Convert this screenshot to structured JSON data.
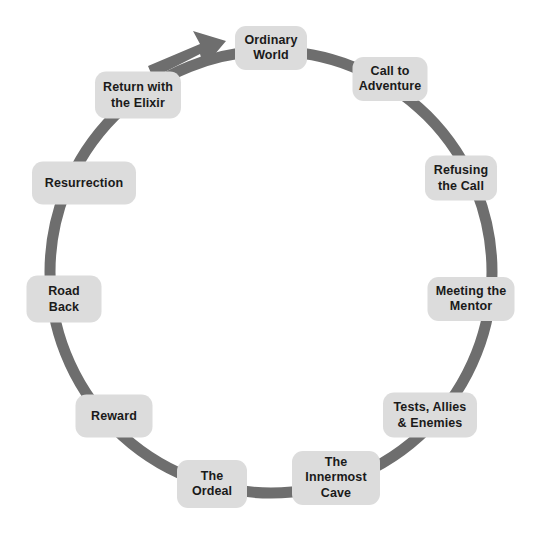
{
  "diagram": {
    "type": "circular-cycle",
    "background_color": "#ffffff",
    "ring": {
      "color": "#6e6e6e",
      "stroke_width": 11,
      "center_x": 271,
      "center_y": 272,
      "radius": 221,
      "direction": "clockwise",
      "arrowhead": {
        "name": "cycle-arrowhead",
        "position_x": 196,
        "position_y": 52,
        "points_toward": "Ordinary World"
      }
    },
    "node_style": {
      "fill": "#dcdcdc",
      "text_color": "#1a1a1a",
      "corner_radius": 11
    },
    "stages": [
      {
        "label": "Ordinary\nWorld",
        "plain": "Ordinary World",
        "order": 1,
        "x": 271,
        "y": 48,
        "w": 72,
        "h": 44,
        "angle_deg": 270
      },
      {
        "label": "Call to\nAdventure",
        "plain": "Call to Adventure",
        "order": 2,
        "x": 390,
        "y": 79,
        "w": 75,
        "h": 44,
        "angle_deg": 303
      },
      {
        "label": "Refusing\nthe Call",
        "plain": "Refusing the Call",
        "order": 3,
        "x": 461,
        "y": 178,
        "w": 72,
        "h": 45,
        "angle_deg": 335
      },
      {
        "label": "Meeting the\nMentor",
        "plain": "Meeting the Mentor",
        "order": 4,
        "x": 471,
        "y": 299,
        "w": 87,
        "h": 44,
        "angle_deg": 7
      },
      {
        "label": "Tests, Allies\n& Enemies",
        "plain": "Tests, Allies & Enemies",
        "order": 5,
        "x": 430,
        "y": 415,
        "w": 94,
        "h": 45,
        "angle_deg": 39
      },
      {
        "label": "The\nInnermost\nCave",
        "plain": "The Innermost Cave",
        "order": 6,
        "x": 336,
        "y": 478,
        "w": 88,
        "h": 54,
        "angle_deg": 68
      },
      {
        "label": "The\nOrdeal",
        "plain": "The Ordeal",
        "order": 7,
        "x": 212,
        "y": 484,
        "w": 70,
        "h": 48,
        "angle_deg": 95
      },
      {
        "label": "Reward",
        "plain": "Reward",
        "order": 8,
        "x": 114,
        "y": 416,
        "w": 77,
        "h": 43,
        "angle_deg": 130
      },
      {
        "label": "Road\nBack",
        "plain": "Road Back",
        "order": 9,
        "x": 64,
        "y": 299,
        "w": 75,
        "h": 47,
        "angle_deg": 165
      },
      {
        "label": "Resurrection",
        "plain": "Resurrection",
        "order": 10,
        "x": 84,
        "y": 183,
        "w": 104,
        "h": 43,
        "angle_deg": 197
      },
      {
        "label": "Return with\nthe Elixir",
        "plain": "Return with the Elixir",
        "order": 11,
        "x": 138,
        "y": 95,
        "w": 86,
        "h": 47,
        "angle_deg": 228
      }
    ]
  }
}
